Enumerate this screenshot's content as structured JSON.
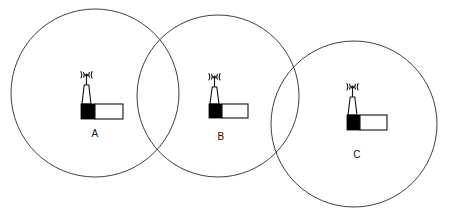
{
  "diagram": {
    "type": "coverage-cell-diagram",
    "canvas": {
      "width": 452,
      "height": 218
    },
    "colors": {
      "background": "#ffffff",
      "circle_stroke": "#2a2a2a",
      "icon_stroke": "#111111",
      "icon_fill_dark": "#000000",
      "icon_fill_light": "#ffffff",
      "label_text": "#111111"
    },
    "cells": [
      {
        "id": "cell-a",
        "label": "A",
        "circle": {
          "cx": 95,
          "cy": 93,
          "r": 84
        },
        "tower": {
          "x": 78,
          "y": 73
        },
        "label_pos": {
          "x": 95,
          "y": 134
        }
      },
      {
        "id": "cell-b",
        "label": "B",
        "circle": {
          "cx": 218,
          "cy": 96,
          "r": 81
        },
        "tower": {
          "x": 206,
          "y": 75
        },
        "label_pos": {
          "x": 221,
          "y": 137
        }
      },
      {
        "id": "cell-c",
        "label": "C",
        "circle": {
          "cx": 354,
          "cy": 124,
          "r": 83
        },
        "tower": {
          "x": 344,
          "y": 85
        },
        "label_pos": {
          "x": 357,
          "y": 155
        }
      }
    ],
    "icon_names": {
      "tower": "cell-tower-icon",
      "waves": "signal-waves-icon",
      "circle": "coverage-area-circle"
    }
  }
}
